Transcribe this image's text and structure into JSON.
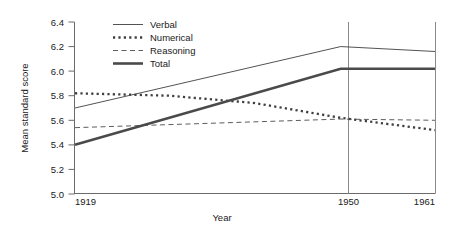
{
  "chart_data": {
    "type": "line",
    "title": "",
    "xlabel": "Year",
    "ylabel": "Mean standard score",
    "x": [
      1919,
      1950,
      1961
    ],
    "xticks": [
      "1919",
      "1950",
      "1961"
    ],
    "xlim": [
      1919,
      1961
    ],
    "ylim": [
      5.0,
      6.4
    ],
    "yticks": [
      "5.0",
      "5.2",
      "5.4",
      "5.6",
      "5.8",
      "6.0",
      "6.2",
      "6.4"
    ],
    "ytick_values": [
      5.0,
      5.2,
      5.4,
      5.6,
      5.8,
      6.0,
      6.2,
      6.4
    ],
    "grid": "vertical-gridlines-at-1950-and-1961",
    "legend_position": "top-center",
    "series": [
      {
        "name": "Verbal",
        "style": "solid-thin",
        "color": "#3f3f3f",
        "width": 0.9,
        "values": [
          5.7,
          6.2,
          6.16
        ],
        "points": [
          {
            "year": 1919,
            "value": 5.7
          },
          {
            "year": 1950,
            "value": 6.2
          },
          {
            "year": 1961,
            "value": 6.16
          }
        ]
      },
      {
        "name": "Numerical",
        "style": "dotted-thick",
        "color": "#3f3f3f",
        "width": 2.3,
        "values": [
          5.82,
          5.62,
          5.52
        ],
        "points": [
          {
            "year": 1919,
            "value": 5.82
          },
          {
            "year": 1930,
            "value": 5.8
          },
          {
            "year": 1940,
            "value": 5.74
          },
          {
            "year": 1950,
            "value": 5.62
          },
          {
            "year": 1961,
            "value": 5.52
          }
        ]
      },
      {
        "name": "Reasoning",
        "style": "dashed-thin",
        "color": "#4a4a4a",
        "width": 0.9,
        "values": [
          5.54,
          5.61,
          5.6
        ],
        "points": [
          {
            "year": 1919,
            "value": 5.54
          },
          {
            "year": 1950,
            "value": 5.61
          },
          {
            "year": 1961,
            "value": 5.6
          }
        ]
      },
      {
        "name": "Total",
        "style": "solid-thick",
        "color": "#4a4a4a",
        "width": 2.6,
        "values": [
          5.4,
          6.02,
          6.02
        ],
        "points": [
          {
            "year": 1919,
            "value": 5.4
          },
          {
            "year": 1950,
            "value": 6.02
          },
          {
            "year": 1961,
            "value": 6.02
          }
        ]
      }
    ]
  },
  "legend": {
    "items": [
      {
        "label": "Verbal"
      },
      {
        "label": "Numerical"
      },
      {
        "label": "Reasoning"
      },
      {
        "label": "Total"
      }
    ]
  },
  "axes": {
    "y_title": "Mean standard score",
    "x_title": "Year",
    "y_ticks": [
      "6.4",
      "6.2",
      "6.0",
      "5.8",
      "5.6",
      "5.4",
      "5.2",
      "5.0"
    ],
    "x_ticks": [
      "1919",
      "1950",
      "1961"
    ]
  }
}
